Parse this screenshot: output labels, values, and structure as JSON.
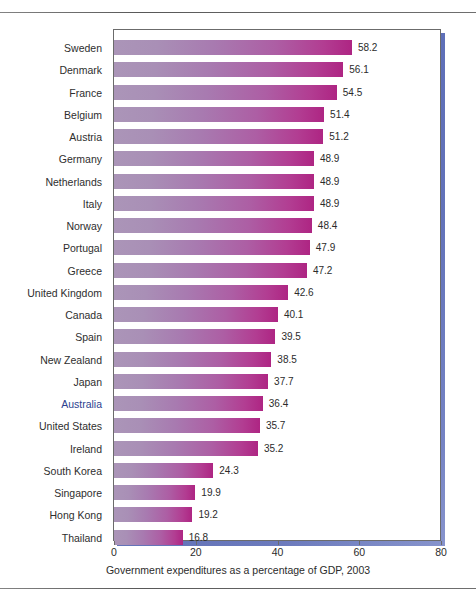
{
  "figure": {
    "accent_shadow_color": "#3b4fa5",
    "bar_gradient_start": "#ab95b8",
    "bar_gradient_end": "#ae2583",
    "highlight_label_color": "#2d3f8f"
  },
  "chart_data": {
    "type": "bar",
    "orientation": "horizontal",
    "title": "",
    "xlabel": "Government expenditures as a percentage of GDP, 2003",
    "ylabel": "",
    "xlim": [
      0,
      80
    ],
    "xticks": [
      0,
      20,
      40,
      60,
      80
    ],
    "xtick_labels": [
      "0",
      "20",
      "40",
      "60",
      "80"
    ],
    "grid": false,
    "legend": "none",
    "highlight_category": "Australia",
    "categories": [
      "Sweden",
      "Denmark",
      "France",
      "Belgium",
      "Austria",
      "Germany",
      "Netherlands",
      "Italy",
      "Norway",
      "Portugal",
      "Greece",
      "United Kingdom",
      "Canada",
      "Spain",
      "New Zealand",
      "Japan",
      "Australia",
      "United States",
      "Ireland",
      "South Korea",
      "Singapore",
      "Hong Kong",
      "Thailand"
    ],
    "values": [
      58.2,
      56.1,
      54.5,
      51.4,
      51.2,
      48.9,
      48.9,
      48.9,
      48.4,
      47.9,
      47.2,
      42.6,
      40.1,
      39.5,
      38.5,
      37.7,
      36.4,
      35.7,
      35.2,
      24.3,
      19.9,
      19.2,
      16.8
    ],
    "value_labels": [
      "58.2",
      "56.1",
      "54.5",
      "51.4",
      "51.2",
      "48.9",
      "48.9",
      "48.9",
      "48.4",
      "47.9",
      "47.2",
      "42.6",
      "40.1",
      "39.5",
      "38.5",
      "37.7",
      "36.4",
      "35.7",
      "35.2",
      "24.3",
      "19.9",
      "19.2",
      "16.8"
    ]
  }
}
